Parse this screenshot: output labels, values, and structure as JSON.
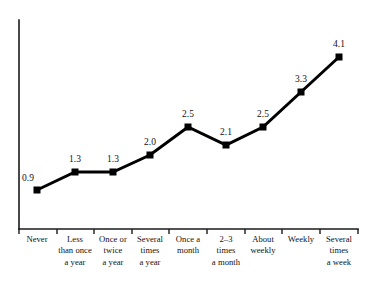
{
  "chart_data": {
    "type": "line",
    "title": "",
    "subtitle": "",
    "xlabel": "",
    "ylabel": "",
    "categories": [
      "Never",
      "Less\nthan once\na year",
      "Once or\ntwice\na year",
      "Several\ntimes\na year",
      "Once a\nmonth",
      "2–3\ntimes\na month",
      "About\nweekly",
      "Weekly",
      "Several\ntimes\na week"
    ],
    "values": [
      0.9,
      1.3,
      1.3,
      2.0,
      2.5,
      2.1,
      2.5,
      3.3,
      4.1
    ],
    "point_labels": [
      "0.9",
      "1.3",
      "1.3",
      "2.0",
      "2.5",
      "2.1",
      "2.5",
      "3.3",
      "4.1"
    ],
    "ylim": [
      0,
      4.6
    ],
    "grid": false,
    "legend": false,
    "legend_position": "none",
    "marker": "square",
    "line_color": "#000000",
    "marker_color": "#000000",
    "axis_color": "#1a1a1a",
    "background_color": "#ffffff"
  },
  "geometry": {
    "points": [
      {
        "x": 37,
        "y": 190
      },
      {
        "x": 75,
        "y": 172
      },
      {
        "x": 113,
        "y": 172
      },
      {
        "x": 150,
        "y": 155
      },
      {
        "x": 188,
        "y": 127
      },
      {
        "x": 226,
        "y": 145
      },
      {
        "x": 263,
        "y": 127
      },
      {
        "x": 301,
        "y": 92
      },
      {
        "x": 339,
        "y": 57
      }
    ],
    "value_label_offsets": [
      {
        "dx": -15,
        "dy": -16
      },
      {
        "dx": -6,
        "dy": -17
      },
      {
        "dx": -6,
        "dy": -17
      },
      {
        "dx": -6,
        "dy": -17
      },
      {
        "dx": -6,
        "dy": -17
      },
      {
        "dx": -6,
        "dy": -17
      },
      {
        "dx": -6,
        "dy": -17
      },
      {
        "dx": -6,
        "dy": -17
      },
      {
        "dx": -6,
        "dy": -17
      }
    ],
    "axis": {
      "y_top": 20,
      "y_bottom": 229,
      "x_left": 19,
      "x_right": 358
    },
    "ticks": [
      19,
      57,
      94,
      132,
      169,
      207,
      245,
      282,
      320,
      358
    ],
    "label_row_top": 234,
    "label_slot_width": 42
  }
}
